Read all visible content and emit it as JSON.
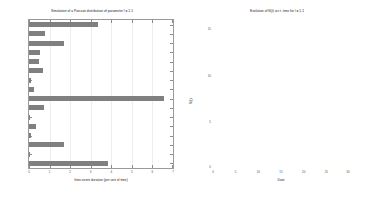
{
  "figure": {
    "background": "#ffffff",
    "axis_color": "#9a9a9a",
    "bar_color": "#808080",
    "line_color": "#6e6e6e"
  },
  "left_panel": {
    "title": "Simulation of a Poisson distribution of parameter l = 1.1",
    "xlabel": "Inter-event duration (per unit of time)",
    "ylabel": ""
  },
  "right_panel": {
    "title": "Evolution of N(t) w.r.t. time for l = 1.1",
    "xlabel": "Date",
    "ylabel": "N(t)"
  },
  "chart_data": [
    {
      "type": "bar",
      "orientation": "horizontal",
      "title": "Simulation of a Poisson distribution of parameter l = 1.1",
      "xlabel": "Inter-event duration (per unit of time)",
      "ylabel": "",
      "xlim": [
        0,
        7
      ],
      "ylim": [
        0,
        17
      ],
      "xticks": [
        0,
        1,
        2,
        3,
        4,
        5,
        6,
        7
      ],
      "xticklabels": [
        "0",
        "1",
        "2",
        "3",
        "4",
        "5",
        "6",
        "7"
      ],
      "yticks": [
        1,
        2,
        3,
        4,
        5,
        6,
        7,
        8,
        9,
        10,
        11,
        12,
        13,
        14,
        15,
        16
      ],
      "yticklabels": [
        "1",
        "2",
        "3",
        "4",
        "5",
        "6",
        "7",
        "8",
        "9",
        "10",
        "11",
        "12",
        "13",
        "14",
        "15",
        "16"
      ],
      "grid": true,
      "categories": [
        "16",
        "15",
        "14",
        "13",
        "12",
        "11",
        "10",
        "9",
        "8",
        "7",
        "6",
        "5",
        "4",
        "3",
        "2",
        "1"
      ],
      "values": [
        3.35,
        0.78,
        1.72,
        0.52,
        0.48,
        0.68,
        0.08,
        0.22,
        6.55,
        0.75,
        0.05,
        0.32,
        0.09,
        1.7,
        0.0,
        3.85
      ]
    },
    {
      "type": "line",
      "subtype": "step",
      "title": "Evolution of N(t) w.r.t. time for l = 1.1",
      "xlabel": "Date",
      "ylabel": "N(t)",
      "xlim": [
        0,
        30
      ],
      "ylim": [
        0,
        16
      ],
      "xticks": [
        0,
        5,
        10,
        15,
        20,
        25,
        30
      ],
      "xticklabels": [
        "0",
        "5",
        "10",
        "15",
        "20",
        "25",
        "30"
      ],
      "yticks": [
        0,
        5,
        10,
        15
      ],
      "yticklabels": [
        "0",
        "5",
        "10",
        "15"
      ],
      "grid": false,
      "series": [
        {
          "name": "N(t)",
          "x": [
            0.0,
            3.85,
            3.85,
            5.55,
            5.55,
            5.64,
            5.96,
            6.01,
            7.71,
            7.71,
            8.46,
            15.01,
            15.01,
            15.09,
            15.57,
            16.05,
            16.57,
            18.29,
            19.07,
            22.42,
            25.77,
            30.0
          ],
          "y": [
            0,
            0,
            1,
            1,
            2,
            3,
            4,
            5,
            5,
            6,
            6,
            6,
            7,
            8,
            9,
            10,
            11,
            12,
            13,
            14,
            15,
            15
          ]
        }
      ]
    }
  ],
  "left_bars": [
    {
      "label": "16",
      "value": 3.35
    },
    {
      "label": "15",
      "value": 0.78
    },
    {
      "label": "14",
      "value": 1.72
    },
    {
      "label": "13",
      "value": 0.52
    },
    {
      "label": "12",
      "value": 0.48
    },
    {
      "label": "11",
      "value": 0.68
    },
    {
      "label": "10",
      "value": 0.08
    },
    {
      "label": "9",
      "value": 0.22
    },
    {
      "label": "8",
      "value": 6.55
    },
    {
      "label": "7",
      "value": 0.75
    },
    {
      "label": "6",
      "value": 0.05
    },
    {
      "label": "5",
      "value": 0.32
    },
    {
      "label": "4",
      "value": 0.09
    },
    {
      "label": "3",
      "value": 1.7
    },
    {
      "label": "2",
      "value": 0.0
    },
    {
      "label": "1",
      "value": 3.85
    }
  ]
}
